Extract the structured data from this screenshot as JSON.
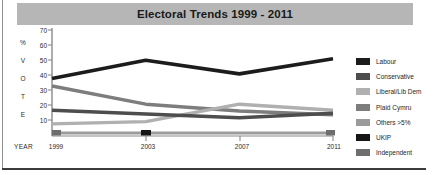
{
  "title": "Electoral Trends 1999 - 2011",
  "axis": {
    "y_letters": [
      "%",
      "V",
      "O",
      "T",
      "E"
    ],
    "y_ticks": [
      70,
      60,
      50,
      40,
      30,
      20,
      10
    ],
    "x_label": "YEAR",
    "x_ticks": [
      "1999",
      "2003",
      "2007",
      "2011"
    ]
  },
  "legend": {
    "items": [
      {
        "label": "Labour",
        "color": "#1c1c1c"
      },
      {
        "label": "Conservative",
        "color": "#4d4d4d"
      },
      {
        "label": "Liberal/Lib Dem",
        "color": "#b0b0b0"
      },
      {
        "label": "Plaid Cymru",
        "color": "#7d7d7d"
      },
      {
        "label": "Others >5%",
        "color": "#9b9b9b"
      },
      {
        "label": "UKIP",
        "color": "#161616"
      },
      {
        "label": "Independent",
        "color": "#6e6e6e"
      }
    ]
  },
  "chart_data": {
    "type": "line",
    "title": "Electoral Trends 1999 - 2011",
    "xlabel": "YEAR",
    "ylabel": "% VOTE",
    "categories": [
      "1999",
      "2003",
      "2007",
      "2011"
    ],
    "ylim": [
      0,
      70
    ],
    "yticks": [
      10,
      20,
      30,
      40,
      50,
      60,
      70
    ],
    "grid": false,
    "legend_position": "right",
    "series": [
      {
        "name": "Labour",
        "color": "#1c1c1c",
        "values": [
          38,
          50,
          41,
          51
        ]
      },
      {
        "name": "Conservative",
        "color": "#4d4d4d",
        "values": [
          17,
          14.5,
          12,
          15
        ]
      },
      {
        "name": "Liberal/Lib Dem",
        "color": "#b0b0b0",
        "values": [
          8,
          9.5,
          21,
          17
        ]
      },
      {
        "name": "Plaid Cymru",
        "color": "#7d7d7d",
        "values": [
          33,
          21,
          16.5,
          14
        ]
      },
      {
        "name": "Others >5%",
        "color": "#9b9b9b",
        "values": [
          2,
          2,
          2,
          2
        ]
      },
      {
        "name": "UKIP",
        "color": "#161616",
        "values": [
          null,
          2.5,
          null,
          null
        ]
      },
      {
        "name": "Independent",
        "color": "#6e6e6e",
        "values": [
          2.5,
          null,
          null,
          2.5
        ]
      }
    ]
  }
}
